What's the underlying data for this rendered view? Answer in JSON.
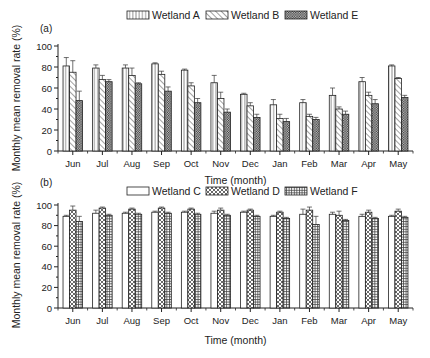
{
  "chart_data": [
    {
      "type": "bar",
      "panel_label": "(a)",
      "title": "",
      "xlabel": "Time (month)",
      "ylabel": "Monthly mean removal rate (%)",
      "ylim": [
        0,
        100
      ],
      "yticks": [
        0,
        20,
        40,
        60,
        80,
        100
      ],
      "grid": false,
      "legend_position": "top-center",
      "categories": [
        "Jun",
        "Jul",
        "Aug",
        "Sep",
        "Oct",
        "Nov",
        "Dec",
        "Jan",
        "Feb",
        "Mar",
        "Apr",
        "May"
      ],
      "series": [
        {
          "name": "Wetland A",
          "pattern": "vertical-lines",
          "values": [
            81,
            79,
            79,
            83,
            77,
            65,
            54,
            44,
            46,
            53,
            66,
            81
          ],
          "errors": [
            8,
            3,
            3,
            1,
            1,
            7,
            1,
            5,
            3,
            7,
            4,
            1
          ]
        },
        {
          "name": "Wetland B",
          "pattern": "diagonal-lines",
          "values": [
            75,
            68,
            72,
            73,
            62,
            50,
            43,
            31,
            33,
            40,
            53,
            69
          ],
          "errors": [
            11,
            4,
            7,
            3,
            3,
            6,
            3,
            4,
            2,
            2,
            3,
            1
          ]
        },
        {
          "name": "Wetland E",
          "pattern": "crosshatch-dense",
          "values": [
            48,
            66,
            64,
            57,
            46,
            37,
            32,
            28,
            30,
            35,
            45,
            51
          ],
          "errors": [
            9,
            2,
            1,
            4,
            4,
            3,
            3,
            3,
            2,
            3,
            4,
            2
          ]
        }
      ]
    },
    {
      "type": "bar",
      "panel_label": "(b)",
      "title": "",
      "xlabel": "Time (month)",
      "ylabel": "Monthly mean removal rate (%)",
      "ylim": [
        0,
        100
      ],
      "yticks": [
        0,
        20,
        40,
        60,
        80,
        100
      ],
      "grid": false,
      "legend_position": "top-center",
      "categories": [
        "Jun",
        "Jul",
        "Aug",
        "Sep",
        "Oct",
        "Nov",
        "Dec",
        "Jan",
        "Feb",
        "Mar",
        "Apr",
        "May"
      ],
      "series": [
        {
          "name": "Wetland C",
          "pattern": "blank",
          "values": [
            89,
            92,
            92,
            93,
            93,
            92,
            93,
            89,
            91,
            91,
            89,
            89
          ],
          "errors": [
            1,
            3,
            1,
            1,
            1,
            2,
            1,
            1,
            5,
            2,
            2,
            1
          ]
        },
        {
          "name": "Wetland D",
          "pattern": "crosshatch-diamond",
          "values": [
            95,
            97,
            96,
            97,
            96,
            95,
            95,
            93,
            95,
            90,
            93,
            94
          ],
          "errors": [
            4,
            1,
            1,
            1,
            1,
            2,
            1,
            1,
            3,
            4,
            2,
            2
          ]
        },
        {
          "name": "Wetland F",
          "pattern": "grid-squares",
          "values": [
            84,
            90,
            91,
            92,
            91,
            90,
            89,
            87,
            81,
            85,
            87,
            88
          ],
          "errors": [
            5,
            1,
            1,
            1,
            1,
            1,
            1,
            1,
            8,
            1,
            1,
            1
          ]
        }
      ]
    }
  ]
}
